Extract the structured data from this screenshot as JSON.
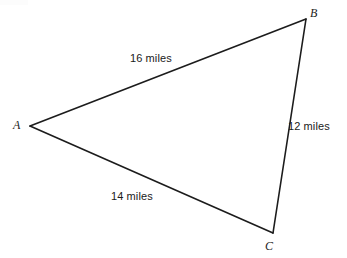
{
  "figure": {
    "type": "triangle-diagram",
    "background_color": "#ffffff",
    "stroke_color": "#1c1c1c",
    "text_color": "#1a1a1a",
    "canvas": {
      "width": 347,
      "height": 258
    }
  },
  "vertices": [
    {
      "name": "A",
      "label": "A",
      "x": 30,
      "y": 126,
      "label_x": 13,
      "label_y": 119
    },
    {
      "name": "B",
      "label": "B",
      "x": 306,
      "y": 19,
      "label_x": 310,
      "label_y": 7
    },
    {
      "name": "C",
      "label": "C",
      "x": 273,
      "y": 233,
      "label_x": 265,
      "label_y": 240
    }
  ],
  "sides": [
    {
      "name": "AB",
      "from": "A",
      "to": "B",
      "label": "16 miles",
      "value": 16,
      "unit": "miles",
      "label_x": 130,
      "label_y": 52
    },
    {
      "name": "BC",
      "from": "B",
      "to": "C",
      "label": "12 miles",
      "value": 12,
      "unit": "miles",
      "label_x": 288,
      "label_y": 120
    },
    {
      "name": "AC",
      "from": "A",
      "to": "C",
      "label": "14 miles",
      "value": 14,
      "unit": "miles",
      "label_x": 111,
      "label_y": 190
    }
  ]
}
